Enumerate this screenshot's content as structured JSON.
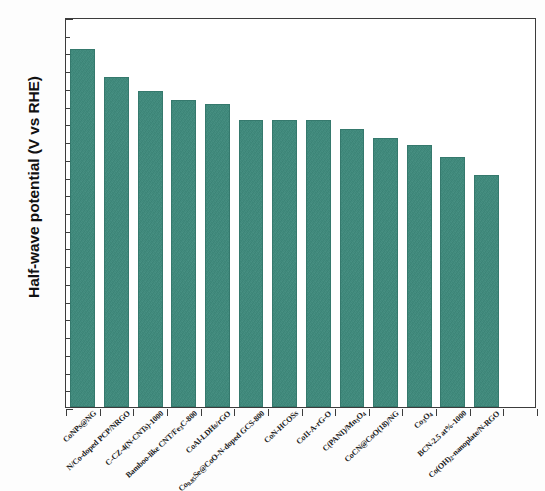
{
  "chart_data": {
    "type": "bar",
    "title": "",
    "xlabel": "",
    "ylabel": "Half-wave potential (V vs RHE)",
    "ylim": [
      0.0,
      1.1
    ],
    "ytick_labels": [
      "0.0",
      "0.1",
      "0.2",
      "0.3",
      "0.4",
      "0.5",
      "0.6",
      "0.7",
      "0.8",
      "0.9",
      "1.0",
      "1.1"
    ],
    "ytick_values": [
      0.0,
      0.1,
      0.2,
      0.3,
      0.4,
      0.5,
      0.6,
      0.7,
      0.8,
      0.9,
      1.0,
      1.1
    ],
    "grid": false,
    "legend": "none",
    "bar_color": "#3e8a7c",
    "axis_color": "#3c3c3c",
    "categories": [
      "CoNPs@NG",
      "N/Co-doped PCP/NRGO",
      "C-CZ-4(N-CNTs)-1000",
      "Bamboo-like CNT/Fe3C-800",
      "CoAl-LDHs/rGO",
      "Co0.85Se@CoO-N-doped GCS-800",
      "CoN-HCOSs",
      "CoII-A-rG-O",
      "C(PANI)/Mn3O4",
      "CoCN@CoO(18)/NG",
      "Co3O4/NG",
      "BCN-2.5 at%-1000",
      "Co(OH)2-nanoplate/N-RGO"
    ],
    "values": [
      1.01,
      0.93,
      0.89,
      0.865,
      0.855,
      0.81,
      0.81,
      0.81,
      0.785,
      0.76,
      0.74,
      0.705,
      0.655
    ],
    "n_bars": 14,
    "bar_labels_rendered": [
      {
        "main": "CoNPs@NG",
        "sub": null,
        "after": null
      },
      {
        "main": "N/Co-doped PCP/NRGO",
        "sub": null,
        "after": null
      },
      {
        "main": "C-CZ-4(N-CNTs)-1000",
        "sub": null,
        "after": null
      },
      {
        "main": "Bamboo-like CNT/Fe",
        "sub": "3",
        "after": "C-800"
      },
      {
        "main": "CoAl-LDHs/rGO",
        "sub": null,
        "after": null
      },
      {
        "main": "Co",
        "sub": "0.85",
        "after": "Se@CoO-N-doped GCS-800"
      },
      {
        "main": "CoN-HCOSs",
        "sub": null,
        "after": null
      },
      {
        "main": "CoII-A-rG-O",
        "sub": null,
        "after": null
      },
      {
        "main": "C(PANI)/Mn",
        "sub": "3",
        "after": "O"
      },
      {
        "main": "CoCN@CoO(18)/NG",
        "sub": null,
        "after": null
      },
      {
        "main": "Co",
        "sub": "3",
        "after": "O"
      },
      {
        "main": "BCN-2.5 at%-1000",
        "sub": null,
        "after": null
      },
      {
        "main": "Co(OH)",
        "sub": "2",
        "after": "-nanoplate/N-RGO"
      }
    ]
  }
}
